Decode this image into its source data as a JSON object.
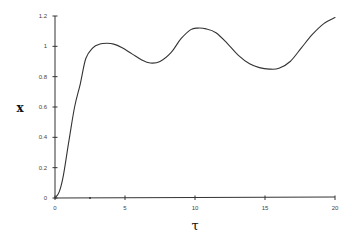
{
  "chart_data": {
    "type": "line",
    "title": "",
    "xlabel": "τ",
    "ylabel": "x",
    "xlim": [
      0,
      20
    ],
    "ylim": [
      0,
      1.2
    ],
    "grid": false,
    "legend": null,
    "x_ticks": [
      0,
      5,
      10,
      15,
      20
    ],
    "x_tick_labels": [
      "0",
      "5",
      "10",
      "15",
      "20"
    ],
    "x_minor_ticks": [
      2.5
    ],
    "y_ticks": [
      0,
      0.2,
      0.4,
      0.6,
      0.8,
      1,
      1.2
    ],
    "y_tick_labels": [
      "0",
      "0.2",
      "0.4",
      "0.6",
      "0.8",
      "1",
      "1.2"
    ],
    "series": [
      {
        "name": "x(τ)",
        "color": "#333333",
        "x": [
          0,
          0.3,
          0.6,
          1.0,
          1.4,
          1.8,
          2.2,
          2.7,
          3.2,
          3.7,
          4.2,
          4.8,
          5.5,
          6.2,
          6.8,
          7.5,
          8.3,
          9.0,
          9.7,
          10.2,
          10.8,
          11.5,
          12.3,
          13.1,
          13.9,
          14.6,
          15.3,
          16.0,
          16.8,
          17.6,
          18.4,
          19.2,
          20.0
        ],
        "y": [
          0,
          0.04,
          0.15,
          0.38,
          0.6,
          0.75,
          0.92,
          0.99,
          1.015,
          1.02,
          1.015,
          0.99,
          0.95,
          0.91,
          0.89,
          0.9,
          0.96,
          1.05,
          1.11,
          1.12,
          1.115,
          1.09,
          1.02,
          0.94,
          0.885,
          0.86,
          0.85,
          0.855,
          0.9,
          0.99,
          1.08,
          1.15,
          1.19
        ]
      }
    ]
  }
}
